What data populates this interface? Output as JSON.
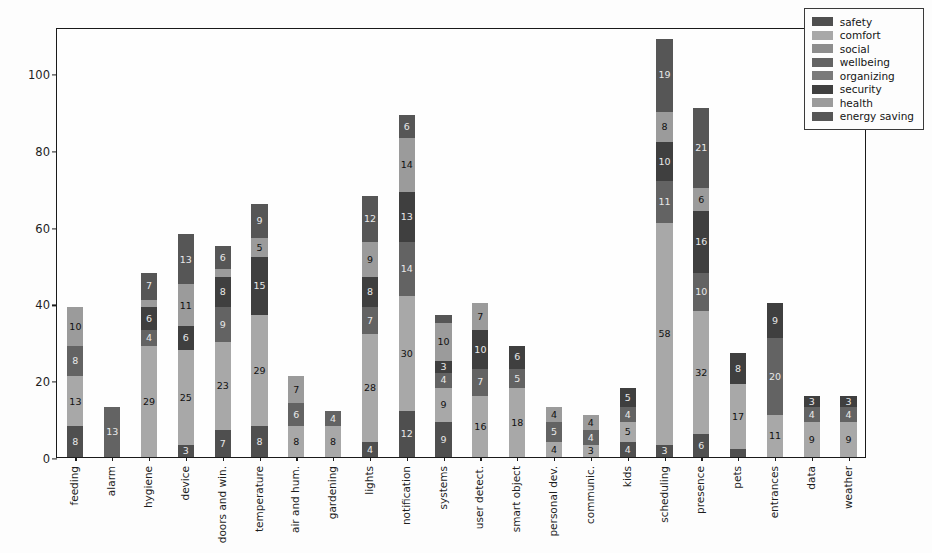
{
  "chart_data": {
    "type": "bar",
    "subtype": "stacked-vertical",
    "title": "",
    "xlabel": "",
    "ylabel": "",
    "ylim": [
      0,
      112
    ],
    "yticks": [
      0,
      20,
      40,
      60,
      80,
      100
    ],
    "grid": false,
    "legend_position": "upper right",
    "categories": [
      "feeding",
      "alarm",
      "hygiene",
      "device",
      "doors and win.",
      "temperature",
      "air and hum.",
      "gardening",
      "lights",
      "notification",
      "systems",
      "user detect.",
      "smart object",
      "personal dev.",
      "communic.",
      "kids",
      "scheduling",
      "presence",
      "pets",
      "entrances",
      "data",
      "weather"
    ],
    "series": [
      {
        "name": "safety",
        "color": "#4f4f4f",
        "values": [
          8,
          0,
          0,
          3,
          7,
          8,
          0,
          0,
          4,
          12,
          9,
          0,
          0,
          0,
          0,
          4,
          3,
          6,
          2,
          0,
          0,
          0
        ]
      },
      {
        "name": "comfort",
        "color": "#a8a8a8",
        "values": [
          13,
          0,
          29,
          25,
          23,
          29,
          8,
          8,
          28,
          30,
          9,
          16,
          18,
          4,
          3,
          5,
          58,
          32,
          17,
          11,
          9,
          9
        ]
      },
      {
        "name": "social",
        "color": "#8d8d8d",
        "values": [
          0,
          0,
          0,
          0,
          0,
          0,
          0,
          0,
          0,
          0,
          0,
          0,
          0,
          0,
          0,
          0,
          0,
          0,
          0,
          0,
          0,
          0
        ]
      },
      {
        "name": "wellbeing",
        "color": "#636363",
        "values": [
          8,
          13,
          4,
          0,
          9,
          0,
          6,
          4,
          7,
          14,
          4,
          7,
          5,
          5,
          4,
          4,
          11,
          10,
          0,
          20,
          4,
          4
        ]
      },
      {
        "name": "organizing",
        "color": "#7a7a7a",
        "values": [
          0,
          0,
          0,
          0,
          0,
          0,
          0,
          0,
          0,
          0,
          0,
          0,
          0,
          0,
          0,
          0,
          0,
          0,
          0,
          0,
          0,
          0
        ]
      },
      {
        "name": "security",
        "color": "#3f3f3f",
        "values": [
          0,
          0,
          6,
          6,
          8,
          15,
          0,
          0,
          8,
          13,
          3,
          10,
          6,
          0,
          0,
          5,
          10,
          16,
          8,
          9,
          3,
          3
        ]
      },
      {
        "name": "health",
        "color": "#9b9b9b",
        "values": [
          10,
          0,
          2,
          11,
          2,
          5,
          7,
          0,
          9,
          14,
          10,
          7,
          0,
          4,
          4,
          0,
          8,
          6,
          0,
          0,
          0,
          0
        ]
      },
      {
        "name": "energy saving",
        "color": "#565656",
        "values": [
          0,
          0,
          7,
          13,
          6,
          9,
          0,
          0,
          12,
          6,
          2,
          0,
          0,
          0,
          0,
          0,
          19,
          21,
          0,
          0,
          0,
          0
        ]
      }
    ],
    "annotations": {
      "note": "Numeric labels are printed inside segments that are tall enough to fit them."
    }
  },
  "legend": {
    "items": [
      {
        "label": "safety",
        "color": "#4f4f4f"
      },
      {
        "label": "comfort",
        "color": "#a8a8a8"
      },
      {
        "label": "social",
        "color": "#8d8d8d"
      },
      {
        "label": "wellbeing",
        "color": "#636363"
      },
      {
        "label": "organizing",
        "color": "#7a7a7a"
      },
      {
        "label": "security",
        "color": "#3f3f3f"
      },
      {
        "label": "health",
        "color": "#9b9b9b"
      },
      {
        "label": "energy saving",
        "color": "#565656"
      }
    ]
  },
  "axes": {
    "y_tick_labels": [
      "0",
      "20",
      "40",
      "60",
      "80",
      "100"
    ],
    "x_tick_labels": [
      "feeding",
      "alarm",
      "hygiene",
      "device",
      "doors and win.",
      "temperature",
      "air and hum.",
      "gardening",
      "lights",
      "notification",
      "systems",
      "user detect.",
      "smart object",
      "personal dev.",
      "communic.",
      "kids",
      "scheduling",
      "presence",
      "pets",
      "entrances",
      "data",
      "weather"
    ]
  }
}
